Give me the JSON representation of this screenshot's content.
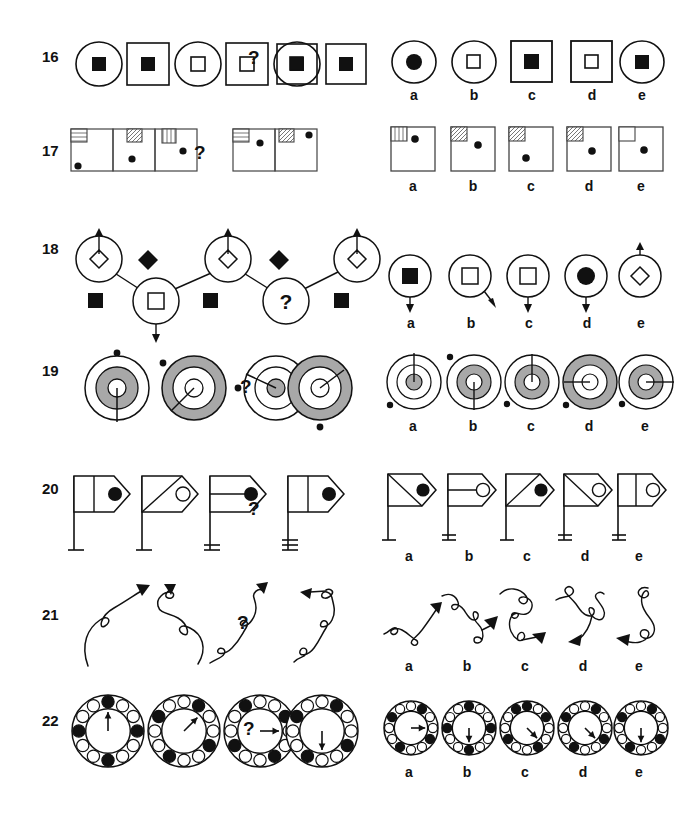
{
  "page": {
    "type": "non-verbal-reasoning-test",
    "width": 659,
    "height": 823,
    "background": "#ffffff",
    "ink": "#111111",
    "gray_fill": "#a8a8a8",
    "hatch_gray": "#bdbdbd"
  },
  "option_labels": [
    "a",
    "b",
    "c",
    "d",
    "e"
  ],
  "question_mark": "?",
  "rows": [
    {
      "number": "16",
      "description": "alternating circle and square frames containing filled or open inner squares",
      "sequence": [
        {
          "frame": "circle",
          "inner": "filled-square"
        },
        {
          "frame": "square",
          "inner": "filled-square"
        },
        {
          "frame": "circle",
          "inner": "open-square"
        },
        {
          "frame": "square",
          "inner": "open-square"
        },
        {
          "frame": "circle",
          "inner": "filled-square"
        },
        {
          "frame": "square",
          "inner": "filled-square"
        },
        {
          "frame": "question",
          "inner": "question"
        },
        {
          "frame": "square",
          "inner": "open-square"
        }
      ],
      "options": [
        {
          "label": "a",
          "frame": "circle",
          "inner": "filled-circle"
        },
        {
          "label": "b",
          "frame": "circle",
          "inner": "open-square"
        },
        {
          "label": "c",
          "frame": "square",
          "inner": "filled-square"
        },
        {
          "label": "d",
          "frame": "square",
          "inner": "open-square"
        },
        {
          "label": "e",
          "frame": "circle",
          "inner": "filled-square"
        }
      ]
    },
    {
      "number": "17",
      "description": "boxes with hatched corner square and a dot at varying heights",
      "sequence": [
        {
          "hatch": "horizontal",
          "dot_x": 0.14,
          "dot_y": 0.84
        },
        {
          "hatch": "diagonal",
          "dot_x": 0.46,
          "dot_y": 0.68
        },
        {
          "hatch": "vertical",
          "dot_x": 0.68,
          "dot_y": 0.52
        },
        {
          "frame": "question"
        },
        {
          "hatch": "horizontal",
          "dot_x": 0.5,
          "dot_y": 0.33
        },
        {
          "hatch": "diagonal",
          "dot_x": 0.82,
          "dot_y": 0.15
        }
      ],
      "options": [
        {
          "label": "a",
          "hatch": "vertical",
          "dot_x": 0.5,
          "dot_y": 0.28
        },
        {
          "label": "b",
          "hatch": "diagonal",
          "dot_x": 0.58,
          "dot_y": 0.42
        },
        {
          "label": "c",
          "hatch": "diagonal",
          "dot_x": 0.38,
          "dot_y": 0.7
        },
        {
          "label": "d",
          "hatch": "diagonal",
          "dot_x": 0.55,
          "dot_y": 0.55
        },
        {
          "label": "e",
          "hatch": "none",
          "dot_x": 0.55,
          "dot_y": 0.52
        }
      ]
    },
    {
      "number": "18",
      "description": "zigzag chain of circles with arrows, alternating with diamonds and squares",
      "sequence": [
        {
          "node": "circle-diamond-up",
          "pos": "peak"
        },
        {
          "node": "filled-diamond",
          "pos": "mid"
        },
        {
          "node": "circle-square-down",
          "pos": "valley"
        },
        {
          "node": "filled-square",
          "pos": "low"
        },
        {
          "node": "circle-diamond-up",
          "pos": "peak"
        },
        {
          "node": "filled-diamond",
          "pos": "mid"
        },
        {
          "node": "circle-question",
          "pos": "valley"
        },
        {
          "node": "filled-square",
          "pos": "low"
        },
        {
          "node": "circle-diamond-up",
          "pos": "peak"
        }
      ],
      "options": [
        {
          "label": "a",
          "inner": "filled-square",
          "arrow": "down"
        },
        {
          "label": "b",
          "inner": "open-square",
          "arrow": "down-right"
        },
        {
          "label": "c",
          "inner": "open-square",
          "arrow": "down"
        },
        {
          "label": "d",
          "inner": "filled-circle",
          "arrow": "down"
        },
        {
          "label": "e",
          "inner": "open-diamond",
          "arrow": "up"
        }
      ]
    },
    {
      "number": "19",
      "description": "concentric ring targets with gray annulus, radius line and external dot",
      "sequence": [
        {
          "rings": "gray-middle-small-core",
          "line": "down",
          "dot": "top"
        },
        {
          "rings": "gray-outer-wide",
          "line": "down-left",
          "dot": "top-left"
        },
        {
          "rings": "white-gray-core",
          "line": "left",
          "dot": "left"
        },
        {
          "frame": "question"
        },
        {
          "rings": "gray-outer-wide",
          "line": "up-right",
          "dot": "bottom"
        }
      ],
      "options": [
        {
          "label": "a",
          "rings": "white-gray-core",
          "line": "up",
          "dot": "bottom-left"
        },
        {
          "label": "b",
          "rings": "gray-middle",
          "line": "down",
          "dot": "top-left"
        },
        {
          "label": "c",
          "rings": "gray-middle",
          "line": "up",
          "dot": "bottom-left"
        },
        {
          "label": "d",
          "rings": "gray-outer-wide",
          "line": "left",
          "dot": "bottom-left"
        },
        {
          "label": "e",
          "rings": "gray-middle",
          "line": "right",
          "dot": "bottom-left"
        }
      ]
    },
    {
      "number": "20",
      "description": "flags on poles with varying internal divisions, dot color and base strokes",
      "sequence": [
        {
          "flag": "vertical-split",
          "dot": "filled",
          "base": 1
        },
        {
          "flag": "diagonal",
          "dot": "open",
          "base": 1
        },
        {
          "flag": "horizontal-split",
          "dot": "filled",
          "base": 2
        },
        {
          "frame": "question"
        },
        {
          "flag": "vertical-split",
          "dot": "filled",
          "base": 3
        }
      ],
      "options": [
        {
          "label": "a",
          "flag": "diagonal",
          "dot": "filled",
          "base": 1
        },
        {
          "label": "b",
          "flag": "horizontal-split",
          "dot": "open",
          "base": 2
        },
        {
          "label": "c",
          "flag": "diagonal",
          "dot": "filled",
          "base": 1
        },
        {
          "label": "d",
          "flag": "diagonal",
          "dot": "open",
          "base": 2
        },
        {
          "label": "e",
          "flag": "vertical-split",
          "dot": "open",
          "base": 2
        }
      ]
    },
    {
      "number": "21",
      "description": "squiggly arrow curves with an increasing number of loops",
      "sequence": [
        {
          "loops": 1,
          "arrow": "up-right"
        },
        {
          "loops": 2,
          "arrow": "up"
        },
        {
          "loops": 3,
          "arrow": "up-right"
        },
        {
          "frame": "question"
        },
        {
          "loops": 4,
          "arrow": "left"
        }
      ],
      "options": [
        {
          "label": "a",
          "loops": 2,
          "arrow": "up-right"
        },
        {
          "label": "b",
          "loops": 3,
          "arrow": "up-right"
        },
        {
          "label": "c",
          "loops": 3,
          "arrow": "right"
        },
        {
          "label": "d",
          "loops": 4,
          "arrow": "down-left"
        },
        {
          "label": "e",
          "loops": 3,
          "arrow": "left"
        }
      ]
    },
    {
      "number": "22",
      "description": "rings of twelve small circles with four filled and a central rotating arrow",
      "sequence": [
        {
          "arrow_deg": 0,
          "filled": [
            0,
            3,
            6,
            9
          ]
        },
        {
          "arrow_deg": 45,
          "filled": [
            1,
            4,
            7,
            10
          ]
        },
        {
          "arrow_deg": 90,
          "filled": [
            2,
            5,
            8,
            11
          ]
        },
        {
          "frame": "question"
        },
        {
          "arrow_deg": 180,
          "filled": [
            1,
            4,
            7,
            10
          ]
        }
      ],
      "options": [
        {
          "label": "a",
          "arrow_deg": 90,
          "filled": [
            1,
            4,
            7,
            10
          ]
        },
        {
          "label": "b",
          "arrow_deg": 180,
          "filled": [
            0,
            3,
            6,
            9
          ]
        },
        {
          "label": "c",
          "arrow_deg": 135,
          "filled": [
            0,
            2,
            5,
            8,
            11
          ]
        },
        {
          "label": "d",
          "arrow_deg": 135,
          "filled": [
            1,
            4,
            7,
            10
          ]
        },
        {
          "label": "e",
          "arrow_deg": 180,
          "filled": [
            1,
            4,
            7,
            10
          ]
        }
      ]
    }
  ]
}
